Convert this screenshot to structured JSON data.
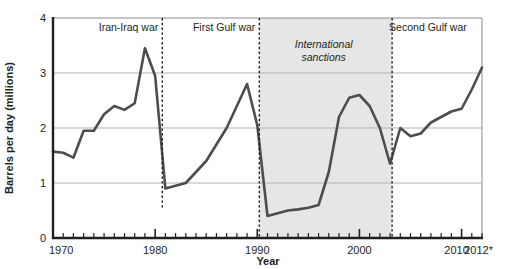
{
  "chart_data": {
    "type": "line",
    "title": "",
    "xlabel": "Year",
    "ylabel": "Barrels per day (millions)",
    "xlim": [
      1970,
      2012
    ],
    "ylim": [
      0,
      4
    ],
    "ytick_labels": [
      "0",
      "1",
      "2",
      "3",
      "4"
    ],
    "ytick_values": [
      0,
      1,
      2,
      3,
      4
    ],
    "xtick_labels": [
      "1970",
      "1980",
      "1990",
      "2000",
      "2010",
      "2012*"
    ],
    "xtick_values": [
      1970,
      1980,
      1990,
      2000,
      2010,
      2012
    ],
    "minor_tick_interval": 1,
    "grid": "horizontal",
    "legend": "none",
    "line_color": "#4d4d4d",
    "line_width": 2.6,
    "shaded_band_color": "#e6e6e6",
    "x": [
      1970,
      1971,
      1972,
      1973,
      1974,
      1975,
      1976,
      1977,
      1978,
      1979,
      1980,
      1981,
      1982,
      1983,
      1984,
      1985,
      1986,
      1987,
      1988,
      1989,
      1990,
      1991,
      1992,
      1993,
      1994,
      1995,
      1996,
      1997,
      1998,
      1999,
      2000,
      2001,
      2002,
      2003,
      2004,
      2005,
      2006,
      2007,
      2008,
      2009,
      2010,
      2011,
      2012
    ],
    "values": [
      1.57,
      1.55,
      1.46,
      1.95,
      1.95,
      2.25,
      2.4,
      2.33,
      2.45,
      3.45,
      2.95,
      0.9,
      0.95,
      1.0,
      1.2,
      1.4,
      1.7,
      2.0,
      2.4,
      2.8,
      2.05,
      0.4,
      0.45,
      0.5,
      0.52,
      0.55,
      0.6,
      1.2,
      2.2,
      2.55,
      2.6,
      2.4,
      2.0,
      1.35,
      2.0,
      1.85,
      1.9,
      2.1,
      2.2,
      2.3,
      2.35,
      2.7,
      3.1
    ],
    "annotations": [
      {
        "name": "iran-iraq-war",
        "label": "Iran-Iraq war",
        "year": 1980.7,
        "label_anchor": "end",
        "label_x": 1980.0,
        "dash_top": 4.0,
        "dash_bottom": 0.55
      },
      {
        "name": "first-gulf-war",
        "label": "First Gulf war",
        "year": 1990.2,
        "label_anchor": "end",
        "label_x": 1990.0,
        "dash_top": 4.0,
        "dash_bottom": 0.0
      },
      {
        "name": "second-gulf-war",
        "label": "Second Gulf war",
        "year": 2003.2,
        "label_anchor": "start",
        "label_x": 2003.0,
        "dash_top": 4.0,
        "dash_bottom": 0.0
      }
    ],
    "shaded_bands": [
      {
        "name": "international-sanctions",
        "label_line1": "International",
        "label_line2": "sanctions",
        "start": 1990.2,
        "end": 2003.2,
        "label_year": 1996.5,
        "label_value": 3.45
      }
    ]
  }
}
